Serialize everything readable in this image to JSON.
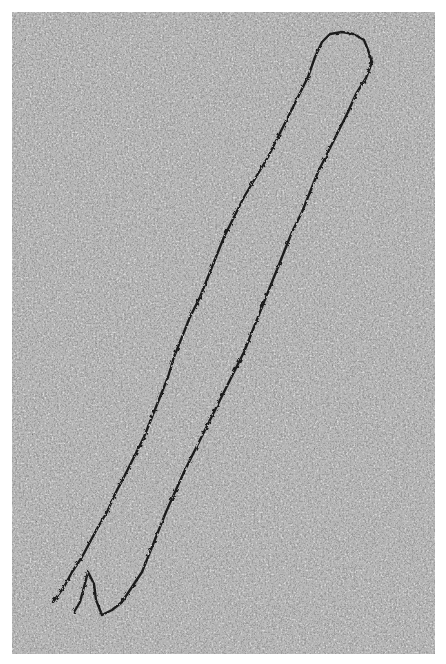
{
  "image": {
    "description": "Electron micrograph of a long linear DNA molecule (hairpin-like loop) on granular background",
    "background_color": "#9a9a9a",
    "strand_color": "#1e1e1e",
    "border_color": "#ffffff"
  }
}
